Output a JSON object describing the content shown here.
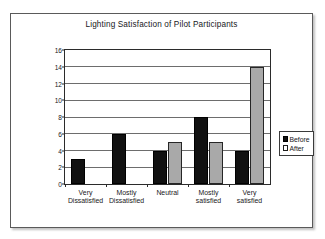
{
  "chart_data": {
    "type": "bar",
    "title": "Lighting Satisfaction of Pilot Participants",
    "xlabel": "",
    "ylabel": "# of Participants",
    "ylim": [
      0,
      16
    ],
    "ytick_step": 2,
    "yticks": [
      0,
      2,
      4,
      6,
      8,
      10,
      12,
      14,
      16
    ],
    "grid": true,
    "legend_position": "right",
    "categories": [
      "Very Dissatisfied",
      "Mostly Dissatisfied",
      "Neutral",
      "Mostly satisfied",
      "Very satisfied"
    ],
    "category_lines": [
      [
        "Very",
        "Dissatisfied"
      ],
      [
        "Mostly",
        "Dissatisfied"
      ],
      [
        "Neutral",
        ""
      ],
      [
        "Mostly",
        "satisfied"
      ],
      [
        "Very",
        "satisfied"
      ]
    ],
    "series": [
      {
        "name": "Before",
        "color": "#111111",
        "values": [
          3,
          6,
          4,
          8,
          4
        ]
      },
      {
        "name": "After",
        "color": "#a9a9a9",
        "values": [
          0,
          0,
          5,
          5,
          14
        ]
      }
    ]
  },
  "legend": {
    "items": [
      {
        "label": "Before"
      },
      {
        "label": "After"
      }
    ]
  },
  "colors": {
    "before": "#111111",
    "after": "#a9a9a9",
    "axis": "#2b2b2b",
    "grid": "#6d6d6d",
    "frame": "#5a5a5a",
    "text": "#17171a"
  }
}
